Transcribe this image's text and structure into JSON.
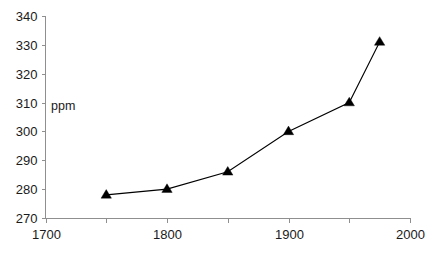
{
  "chart_data": {
    "type": "line",
    "title": "",
    "subtitle": "",
    "xlabel": "",
    "ylabel": "ppm",
    "xlim": [
      1700,
      2000
    ],
    "ylim": [
      270,
      340
    ],
    "xticks": [
      1700,
      1750,
      1800,
      1850,
      1900,
      1950,
      2000
    ],
    "xtick_labels": [
      "1700",
      "",
      "1800",
      "",
      "1900",
      "",
      "2000"
    ],
    "yticks": [
      270,
      280,
      290,
      300,
      310,
      320,
      330,
      340
    ],
    "ytick_labels": [
      "270",
      "280",
      "290",
      "300",
      "310",
      "320",
      "330",
      "340"
    ],
    "grid": false,
    "legend": null,
    "marker": "triangle",
    "line_color": "#000000",
    "marker_color": "#000000",
    "axis_color": "#8f8f8f",
    "series": [
      {
        "name": "ppm",
        "x": [
          1750,
          1800,
          1850,
          1900,
          1950,
          1975
        ],
        "values": [
          278,
          280,
          286,
          300,
          310,
          331
        ]
      }
    ]
  },
  "axis": {
    "y_label_text": "ppm"
  }
}
